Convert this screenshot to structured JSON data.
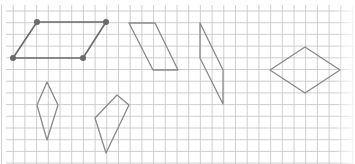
{
  "diagram": {
    "type": "grid-figures",
    "grid": {
      "x_start": 1.5,
      "y_start": 11,
      "spacing": 11.7,
      "cols": 30,
      "rows": 14,
      "line_color": "#c8c8c8",
      "border_fade": true
    },
    "colors": {
      "background": "#ffffff",
      "figure_stroke": "#8a8a8a",
      "figure_1_stroke": "#6a6a6a",
      "vertex_dot": "#6a6a6a"
    },
    "figures": [
      {
        "id": "figure-1-parallelogram",
        "shape": "parallelogram",
        "points": [
          [
            37,
            22
          ],
          [
            106,
            22
          ],
          [
            83,
            58
          ],
          [
            13,
            58
          ]
        ],
        "vertex_dots": true
      },
      {
        "id": "figure-2-parallelogram",
        "shape": "parallelogram",
        "points": [
          [
            129,
            23
          ],
          [
            155,
            23
          ],
          [
            178,
            70
          ],
          [
            153,
            70
          ]
        ],
        "vertex_dots": false
      },
      {
        "id": "figure-3-parallelogram",
        "shape": "parallelogram",
        "points": [
          [
            200,
            23
          ],
          [
            223,
            70
          ],
          [
            223,
            104
          ],
          [
            200,
            58
          ]
        ],
        "vertex_dots": false
      },
      {
        "id": "figure-4-rhombus",
        "shape": "rhombus",
        "points": [
          [
            270,
            70
          ],
          [
            305,
            47
          ],
          [
            340,
            70
          ],
          [
            305,
            93
          ]
        ],
        "vertex_dots": false
      },
      {
        "id": "figure-5-kite",
        "shape": "kite",
        "points": [
          [
            47,
            82
          ],
          [
            58,
            105
          ],
          [
            47,
            140
          ],
          [
            37,
            105
          ]
        ],
        "vertex_dots": false
      },
      {
        "id": "figure-6-quadrilateral",
        "shape": "quadrilateral",
        "points": [
          [
            95,
            118
          ],
          [
            117,
            95
          ],
          [
            129,
            105
          ],
          [
            106,
            153
          ]
        ],
        "vertex_dots": false
      }
    ]
  }
}
